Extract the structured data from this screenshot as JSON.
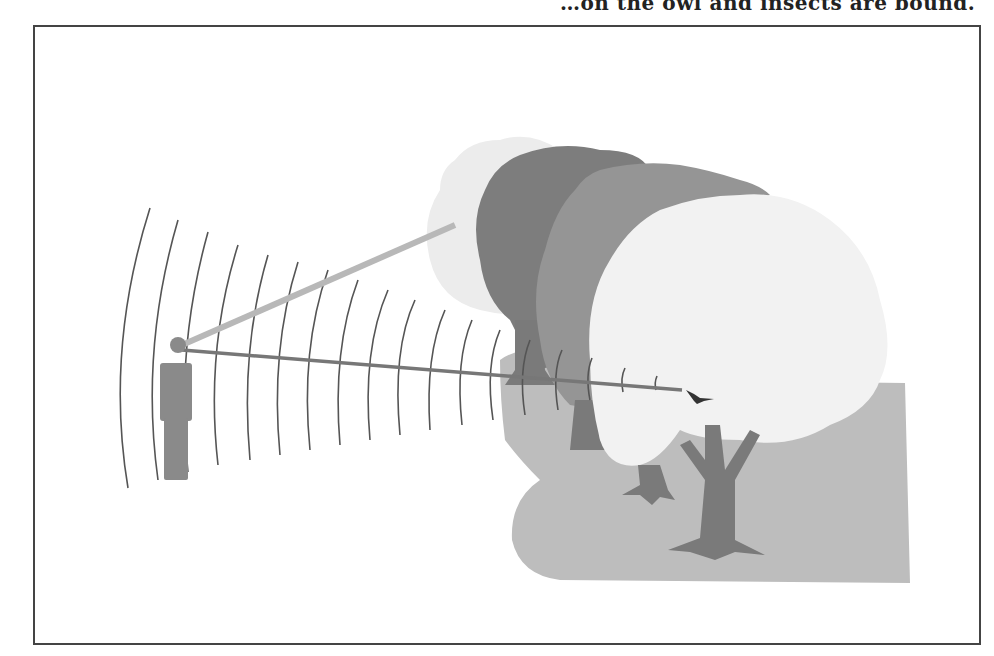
{
  "caption_fragment": "…on the owl and insects are bound.",
  "figure": {
    "elements": {
      "observer": "person silhouette",
      "sound_waves": "concentric arcs radiating from observer",
      "direct_line": "line of sound from observer to bird",
      "sight_line": "faint line toward distant tree canopy",
      "trees": [
        "far tree (pale)",
        "dark tree",
        "mid-grey tree",
        "near tree (light canopy)"
      ],
      "bird": "small bird perched at end of direct line",
      "ground": "grey ground area"
    },
    "colors": {
      "dark_tree": "#7d7d7d",
      "mid_tree": "#959595",
      "pale_tree": "#e8e8e8",
      "near_canopy": "#f0f0f0",
      "ground": "#bdbdbd",
      "trunk": "#7a7a7a",
      "wave_line": "#555555",
      "figure": "#8a8a8a"
    }
  }
}
